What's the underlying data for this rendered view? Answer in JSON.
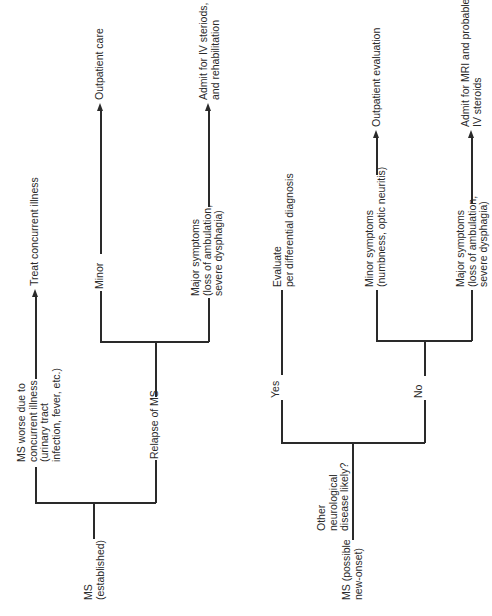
{
  "diagram": {
    "type": "decision-tree",
    "orientation": "rotated-90-ccw",
    "left_tree": {
      "root": "MS\n(established)",
      "branch_concurrent": "MS worse due to\nconcurrent illness\n(urinary tract\ninfection, fever, etc.)",
      "outcome_concurrent": "Treat concurrent illness",
      "branch_relapse": "Relapse of MS",
      "minor_label": "Minor",
      "minor_outcome": "Outpatient care",
      "major_label": "Major symptoms\n(loss of ambulation,\nsevere dysphagia)",
      "major_outcome": "Admit for IV steriods,\nand rehabilitation"
    },
    "right_tree": {
      "root": "MS (possible\nnew-onset)",
      "question": "Other\nneurological\ndisease likely?",
      "yes_label": "Yes",
      "yes_outcome": "Evaluate\nper differential diagnosis",
      "no_label": "No",
      "minor_label": "Minor symptoms\n(numbness, optic neuritis)",
      "minor_outcome": "Outpatient evaluation",
      "major_label": "Major symptoms\n(loss of ambulation,\nsevere dysphagia)",
      "major_outcome": "Admit for MRI and probable\nIV steroids"
    }
  }
}
